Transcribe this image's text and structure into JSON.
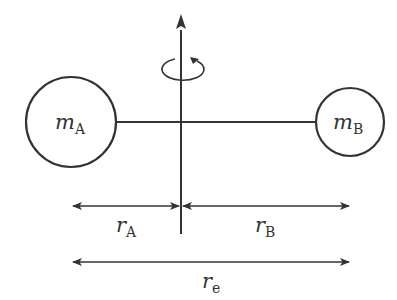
{
  "diagram": {
    "type": "diatomic-molecule-rotation",
    "stroke_color": "#333333",
    "masses": [
      {
        "symbol": "m",
        "subscript": "A"
      },
      {
        "symbol": "m",
        "subscript": "B"
      }
    ],
    "distances": [
      {
        "symbol": "r",
        "subscript": "A"
      },
      {
        "symbol": "r",
        "subscript": "B"
      },
      {
        "symbol": "r",
        "subscript": "e"
      }
    ],
    "rotation_icon": "rotation-arrow-icon",
    "axis_icon": "rotation-axis-arrow"
  }
}
